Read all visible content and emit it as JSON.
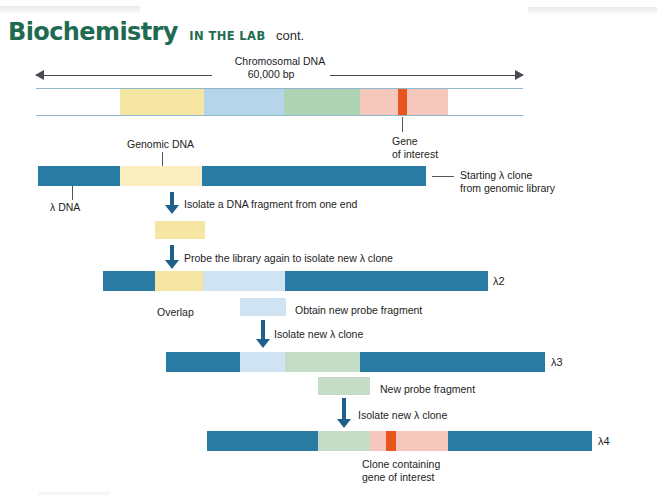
{
  "header": {
    "title": "Biochemistry",
    "subtitle": "IN THE LAB",
    "cont": "cont.",
    "color": "#1f6b51"
  },
  "colors": {
    "lambda_dna": "#2a7ba4",
    "yellow": "#f6e6a4",
    "yellow_pale": "#fbeec0",
    "light_blue": "#b6d5ea",
    "light_blue_pale": "#cfe3f2",
    "green": "#aed2b4",
    "green_pale": "#c5dcc6",
    "pink": "#f6c8bd",
    "orange_gene": "#e8561b",
    "rail": "#8fb8cf",
    "arrow": "#1f5f8b",
    "leader": "#55555c"
  },
  "chromosome": {
    "title": "Chromosomal DNA",
    "length_label": "60,000 bp",
    "segments": [
      {
        "name": "genomic-yellow",
        "color": "#f6e6a4"
      },
      {
        "name": "genomic-light-blue",
        "color": "#b6d5ea"
      },
      {
        "name": "genomic-green",
        "color": "#aed2b4"
      },
      {
        "name": "genomic-pink",
        "color": "#f6c8bd"
      },
      {
        "name": "gene-of-interest",
        "color": "#e8561b"
      }
    ]
  },
  "labels": {
    "genomic_dna": "Genomic DNA",
    "gene_of_interest_line1": "Gene",
    "gene_of_interest_line2": "of interest",
    "lambda_dna": "λ DNA",
    "starting_clone_line1": "Starting λ clone",
    "starting_clone_line2": "from genomic library",
    "overlap": "Overlap",
    "obtain_new_probe": "Obtain new probe fragment",
    "new_probe": "New probe fragment",
    "clone_containing_line1": "Clone containing",
    "clone_containing_line2": "gene of interest"
  },
  "steps": [
    {
      "id": "step-1",
      "text": "Isolate a DNA fragment from one end"
    },
    {
      "id": "step-2",
      "text": "Probe the library again to isolate new λ clone"
    },
    {
      "id": "step-3",
      "text": "Isolate new λ clone"
    },
    {
      "id": "step-4",
      "text": "Isolate new λ clone"
    }
  ],
  "clones": [
    {
      "id": "clone-start",
      "label": ""
    },
    {
      "id": "clone-2",
      "label": "λ2"
    },
    {
      "id": "clone-3",
      "label": "λ3"
    },
    {
      "id": "clone-4",
      "label": "λ4"
    }
  ]
}
